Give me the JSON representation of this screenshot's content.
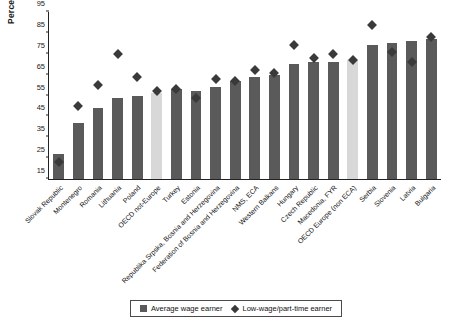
{
  "chart_data": {
    "type": "bar",
    "title": "",
    "xlabel": "",
    "ylabel": "Percentage",
    "ylim": [
      15,
      95
    ],
    "ytick_step": 10,
    "yticks": [
      15,
      25,
      35,
      45,
      55,
      65,
      75,
      85,
      95
    ],
    "grid": false,
    "legend_position": "bottom",
    "categories": [
      "Slovak Republic",
      "Montenegro",
      "Romania",
      "Lithuania",
      "Poland",
      "OECD not-Europe",
      "Turkey",
      "Estonia",
      "Republika Srpska, Bosnia and Herzegovina",
      "Federation of Bosnia and Herzegovina",
      "NMS, ECA",
      "Western Balkans",
      "Hungary",
      "Czech Republic",
      "Macedonia, FYR",
      "OECD Europe (non ECA)",
      "Serbia",
      "Slovenia",
      "Latvia",
      "Bulgaria"
    ],
    "series": [
      {
        "name": "Average wage earner",
        "type": "bar",
        "color": "#5a5a5a",
        "highlight_color": "#d8d8d8",
        "highlight_indices": [
          5,
          15
        ],
        "values": [
          27,
          42,
          49,
          54,
          55,
          56,
          58,
          57,
          59,
          62,
          64,
          65,
          70,
          71,
          71,
          72,
          79,
          80,
          81,
          82
        ]
      },
      {
        "name": "Low-wage/part-time earner",
        "type": "scatter",
        "marker": "diamond",
        "color": "#3a3a3a",
        "values": [
          23,
          50,
          60,
          75,
          64,
          57,
          58,
          54,
          63,
          62,
          67,
          66,
          79,
          73,
          75,
          72,
          89,
          76,
          71,
          83
        ]
      }
    ]
  },
  "legend": {
    "items": [
      {
        "label": "Average wage earner",
        "marker": "square"
      },
      {
        "label": "Low-wage/part-time earner",
        "marker": "diamond"
      }
    ]
  }
}
